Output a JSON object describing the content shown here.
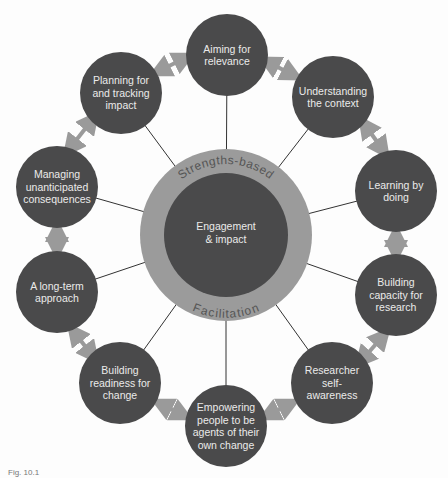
{
  "diagram": {
    "center": {
      "label_line1": "Engagement",
      "label_line2": "& impact"
    },
    "ring": {
      "top_label": "Strengths-based",
      "bottom_label": "Facilitation"
    },
    "nodes": [
      {
        "label": "Aiming for relevance",
        "x": 227,
        "y": 55
      },
      {
        "label": "Understanding the context",
        "x": 333,
        "y": 97
      },
      {
        "label": "Learning by doing",
        "x": 396,
        "y": 191
      },
      {
        "label": "Building capacity for research",
        "x": 396,
        "y": 295
      },
      {
        "label": "Researcher self-awareness",
        "x": 332,
        "y": 383
      },
      {
        "label": "Empowering people to be agents of their own change",
        "x": 226,
        "y": 426
      },
      {
        "label": "Building readiness for change",
        "x": 120,
        "y": 383
      },
      {
        "label": "A long-term approach",
        "x": 57,
        "y": 292
      },
      {
        "label": "Managing unanticipated consequences",
        "x": 57,
        "y": 187
      },
      {
        "label": "Planning for and tracking impact",
        "x": 121,
        "y": 93
      }
    ],
    "caption": "Fig. 10.1"
  },
  "colors": {
    "node": "#4a4a4b",
    "ring": "#9b9b9b",
    "arrow": "#9a9a9a",
    "line": "#333333"
  }
}
